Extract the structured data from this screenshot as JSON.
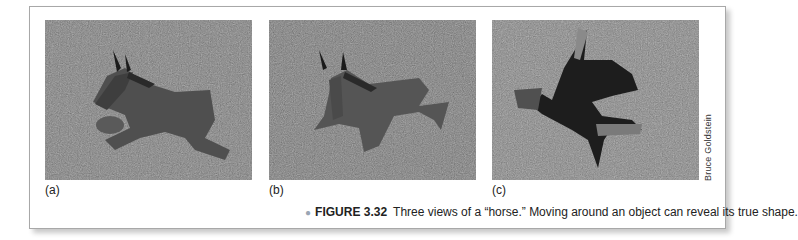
{
  "figure": {
    "number": "FIGURE 3.32",
    "caption": "Three views of a “horse.” Moving around an object can reveal its true shape.",
    "credit": "Bruce Goldstein",
    "panels": [
      {
        "label": "(a)",
        "description": "Side view of a flat metal horse sculpture lying on grass"
      },
      {
        "label": "(b)",
        "description": "Angled view of the same horse sculpture on grass"
      },
      {
        "label": "(c)",
        "description": "Front-facing view revealing the sculpture is made of separate flat pieces"
      }
    ]
  },
  "colors": {
    "frame_border": "#a8a8a8",
    "bullet": "#9aa6b4",
    "text": "#222222"
  }
}
